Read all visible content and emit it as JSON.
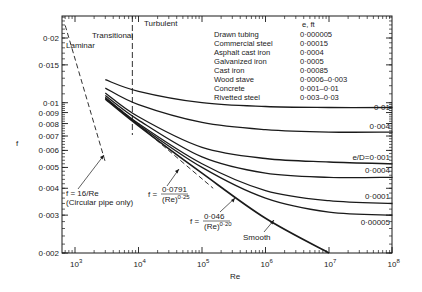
{
  "chart_data": {
    "type": "line",
    "title": "",
    "xlabel": "Re",
    "ylabel": "f",
    "x_scale": "log",
    "y_scale": "log",
    "xlim": [
      630,
      100000000
    ],
    "ylim": [
      0.002,
      0.025
    ],
    "x_ticks": [
      {
        "value": 1000,
        "label": "10",
        "exp": "3"
      },
      {
        "value": 10000,
        "label": "10",
        "exp": "4"
      },
      {
        "value": 100000,
        "label": "10",
        "exp": "5"
      },
      {
        "value": 1000000,
        "label": "10",
        "exp": "6"
      },
      {
        "value": 10000000,
        "label": "10",
        "exp": "7"
      },
      {
        "value": 100000000,
        "label": "10",
        "exp": "8"
      }
    ],
    "y_ticks": [
      {
        "value": 0.002,
        "label": "0·002"
      },
      {
        "value": 0.003,
        "label": "0·003"
      },
      {
        "value": 0.004,
        "label": "0·004"
      },
      {
        "value": 0.005,
        "label": "0·005"
      },
      {
        "value": 0.006,
        "label": "0·006"
      },
      {
        "value": 0.007,
        "label": "0·007"
      },
      {
        "value": 0.008,
        "label": "0·008"
      },
      {
        "value": 0.009,
        "label": "0·009"
      },
      {
        "value": 0.01,
        "label": "0·01"
      },
      {
        "value": 0.015,
        "label": "0·015"
      },
      {
        "value": 0.02,
        "label": "0·02"
      }
    ],
    "grid": false,
    "regions": [
      {
        "label": "Laminar"
      },
      {
        "label": "Transitional"
      },
      {
        "label": "Turbulent",
        "boundary_Re": 8000
      }
    ],
    "series": [
      {
        "name": "e/D = 0·01",
        "label": "0·01",
        "style": "solid",
        "x": [
          3000,
          10000,
          100000,
          1000000,
          10000000,
          100000000
        ],
        "y": [
          0.0128,
          0.0113,
          0.01,
          0.0096,
          0.0095,
          0.0095
        ]
      },
      {
        "name": "e/D = 0·004",
        "label": "0·004",
        "style": "solid",
        "x": [
          3000,
          10000,
          100000,
          1000000,
          10000000,
          100000000
        ],
        "y": [
          0.0117,
          0.0098,
          0.0081,
          0.0075,
          0.0073,
          0.0073
        ]
      },
      {
        "name": "e/D = 0·001",
        "label": "e/D=0·001",
        "style": "solid",
        "x": [
          3000,
          10000,
          100000,
          1000000,
          10000000,
          100000000
        ],
        "y": [
          0.0111,
          0.0086,
          0.0062,
          0.0055,
          0.0053,
          0.0052
        ]
      },
      {
        "name": "e/D = 0·0004",
        "label": "0·0004",
        "style": "solid",
        "x": [
          3000,
          10000,
          100000,
          1000000,
          10000000,
          100000000
        ],
        "y": [
          0.0108,
          0.0083,
          0.0056,
          0.0047,
          0.0045,
          0.0045
        ]
      },
      {
        "name": "e/D = 0·0001",
        "label": "0·0001",
        "style": "solid",
        "x": [
          3000,
          10000,
          100000,
          1000000,
          10000000,
          100000000
        ],
        "y": [
          0.0106,
          0.008,
          0.0052,
          0.0039,
          0.0035,
          0.0034
        ]
      },
      {
        "name": "e/D = 0·00005",
        "label": "0·00005",
        "style": "solid",
        "x": [
          3000,
          10000,
          100000,
          1000000,
          10000000,
          100000000
        ],
        "y": [
          0.0105,
          0.0079,
          0.005,
          0.0036,
          0.0031,
          0.003
        ]
      },
      {
        "name": "Smooth",
        "label": "Smooth",
        "style": "solid",
        "x": [
          3000,
          10000,
          100000,
          1000000,
          10000000
        ],
        "y": [
          0.0104,
          0.0078,
          0.0047,
          0.0029,
          0.002
        ]
      },
      {
        "name": "f = 16/Re (Circular pipe only)",
        "label": "f = 16/Re",
        "style": "dashed",
        "x": [
          700,
          3000
        ],
        "y": [
          0.0229,
          0.0053
        ]
      },
      {
        "name": "f = 0·0791/(Re)^0·25",
        "label": "f = 0·0791/(Re)^0·25",
        "style": "dashed",
        "x": [
          5000,
          150000
        ],
        "y": [
          0.0094,
          0.004
        ]
      }
    ],
    "legend": {
      "position": "top-right",
      "header": "e, ft",
      "rows": [
        {
          "material": "Drawn tubing",
          "e_ft": "0·000005"
        },
        {
          "material": "Commercial steel",
          "e_ft": "0·00015"
        },
        {
          "material": "Asphalt cast iron",
          "e_ft": "0·0004"
        },
        {
          "material": "Galvanized iron",
          "e_ft": "0·0005"
        },
        {
          "material": "Cast iron",
          "e_ft": "0·00085"
        },
        {
          "material": "Wood stave",
          "e_ft": "0·0006–0·003"
        },
        {
          "material": "Concrete",
          "e_ft": "0·001–0·01"
        },
        {
          "material": "Rivetted steel",
          "e_ft": "0·003–0·03"
        }
      ]
    },
    "annotations": [
      {
        "text": "f = 16/Re",
        "sub": "(Circular pipe only)"
      },
      {
        "text": "f =",
        "num": "0·0791",
        "den": "(Re)",
        "den_exp": "0·25"
      },
      {
        "text": "f =",
        "num": "0·046",
        "den": "(Re)",
        "den_exp": "0·20"
      },
      {
        "text": "Smooth"
      }
    ]
  }
}
